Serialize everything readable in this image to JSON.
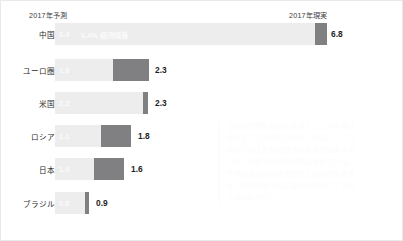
{
  "header": {
    "forecast_label": "2017年予測",
    "actual_label": "2017年現実"
  },
  "chart_data": {
    "type": "bar",
    "title": "",
    "xlabel": "",
    "ylabel": "",
    "categories": [
      "中国",
      "ユーロ圏",
      "米国",
      "ロシア",
      "日本",
      "ブラジル"
    ],
    "series": [
      {
        "name": "2017年予測",
        "values": [
          6.4,
          1.8,
          2.2,
          1.1,
          1.0,
          0.8
        ]
      },
      {
        "name": "2017年現実",
        "values": [
          6.8,
          2.3,
          2.3,
          1.8,
          1.6,
          0.9
        ]
      }
    ],
    "xlim": [
      0,
      7.2
    ],
    "grid": false,
    "legend_position": "top",
    "annotations": [
      "6.4% 経済成長"
    ]
  },
  "rows": [
    {
      "label": "中国",
      "forecast": "6.4",
      "note": "6.4% 経済成長",
      "actual": "6.8",
      "top": 22,
      "light_width": 260,
      "dark_left": 260,
      "dark_width": 12,
      "value_left": 330
    },
    {
      "label": "ユーロ圏",
      "forecast": "1.8",
      "note": "",
      "actual": "2.3",
      "top": 58,
      "light_width": 58,
      "dark_left": 58,
      "dark_width": 36,
      "value_left": 154
    },
    {
      "label": "米国",
      "forecast": "2.2",
      "note": "",
      "actual": "2.3",
      "top": 91,
      "light_width": 88,
      "dark_left": 88,
      "dark_width": 5,
      "value_left": 154
    },
    {
      "label": "ロシア",
      "forecast": "1.1",
      "note": "",
      "actual": "1.8",
      "top": 124,
      "light_width": 46,
      "dark_left": 46,
      "dark_width": 30,
      "value_left": 137
    },
    {
      "label": "日本",
      "forecast": "1.0",
      "note": "",
      "actual": "1.6",
      "top": 157,
      "light_width": 39,
      "dark_left": 39,
      "dark_width": 30,
      "value_left": 130
    },
    {
      "label": "ブラジル",
      "forecast": "0.8",
      "note": "",
      "actual": "0.9",
      "top": 191,
      "light_width": 30,
      "dark_left": 30,
      "dark_width": 4,
      "value_left": 95
    }
  ],
  "watermark": {
    "lines": [
      "その国際通貨基金によると、この予測は",
      "前回より上方修正された。中国、ユーロ",
      "圏などの主要経済圏では成長が加速する",
      "一方、米国では減速が見込まれている。",
      "世界経済は当初の予想を上回る回復を見",
      "せ、新興国を中心に投資が拡大している",
      "との分析を示した。"
    ]
  },
  "colors": {
    "bar_light": "#ededee",
    "bar_dark": "#808083",
    "value_text": "#1e1e1e",
    "border": "#e9e9ea"
  }
}
